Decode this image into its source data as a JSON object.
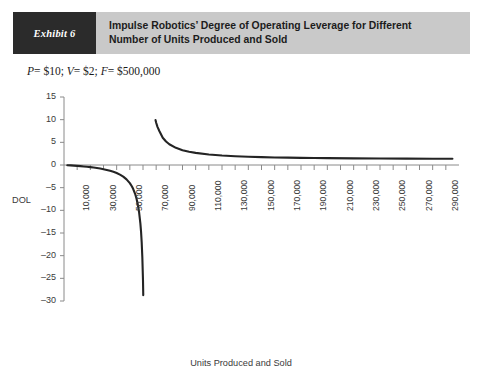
{
  "exhibit": {
    "tag": "Exhibit 6",
    "title_line1": "Impulse Robotics’ Degree of Operating Leverage for Different",
    "title_line2": "Number of Units Produced and Sold",
    "tag_bg": "#2b2b2b",
    "title_bg": "#c9c9c9"
  },
  "parameters": {
    "full": "P = $10; V = $2; F = $500,000",
    "price_symbol": "P",
    "price_value": "= $10;",
    "variable_symbol": "V",
    "variable_value": "= $2;",
    "fixed_symbol": "F",
    "fixed_value": "= $500,000"
  },
  "chart_data": {
    "type": "line",
    "title": "Impulse Robotics’ Degree of Operating Leverage for Different Number of Units Produced and Sold",
    "subtitle": "P = $10; V = $2; F = $500,000",
    "xlabel": "Units Produced and Sold",
    "ylabel": "DOL",
    "xlim": [
      0,
      300000
    ],
    "ylim": [
      -30,
      15
    ],
    "ytick_values": [
      15,
      10,
      5,
      0,
      -5,
      -10,
      -15,
      -20,
      -25,
      -30
    ],
    "ytick_labels": [
      "15",
      "10",
      "5",
      "0",
      "–5",
      "–10",
      "–15",
      "–20",
      "–25",
      "–30"
    ],
    "xtick_values": [
      10000,
      30000,
      50000,
      70000,
      90000,
      110000,
      130000,
      150000,
      170000,
      190000,
      210000,
      230000,
      250000,
      270000,
      290000
    ],
    "xtick_labels": [
      "10,000",
      "30,000",
      "50,000",
      "70,000",
      "90,000",
      "110,000",
      "130,000",
      "150,000",
      "170,000",
      "190,000",
      "210,000",
      "230,000",
      "250,000",
      "270,000",
      "290,000"
    ],
    "grid": false,
    "legend": null,
    "line_color": "#242424",
    "axis_color": "#8a8a8a",
    "breakeven_units": 62500,
    "formula": "DOL = Q(P-V) / (Q(P-V) - F)",
    "series": [
      {
        "name": "DOL below breakeven",
        "x": [
          2500,
          5000,
          7500,
          10000,
          12500,
          15000,
          17500,
          20000,
          22500,
          25000,
          27500,
          30000,
          32500,
          35000,
          37500,
          40000,
          42500,
          45000,
          47500,
          50000,
          51500,
          52500,
          54000,
          55000,
          56000,
          57000,
          58000,
          58500,
          59000,
          59500,
          60000,
          60200
        ],
        "y": [
          -0.042,
          -0.087,
          -0.136,
          -0.19,
          -0.25,
          -0.316,
          -0.389,
          -0.471,
          -0.562,
          -0.667,
          -0.786,
          -0.923,
          -1.083,
          -1.273,
          -1.5,
          -1.778,
          -2.125,
          -2.571,
          -3.167,
          -4.0,
          -4.682,
          -5.25,
          -6.353,
          -7.333,
          -8.615,
          -10.364,
          -12.889,
          -14.625,
          -17.0,
          -20.4,
          -25.5,
          -28.7
        ]
      },
      {
        "name": "DOL above breakeven",
        "x": [
          69500,
          70000,
          71000,
          72500,
          75000,
          77500,
          80000,
          85000,
          90000,
          95000,
          100000,
          110000,
          120000,
          130000,
          140000,
          150000,
          160000,
          170000,
          180000,
          190000,
          200000,
          220000,
          240000,
          260000,
          280000,
          295000
        ],
        "y": [
          9.93,
          9.33,
          8.41,
          7.45,
          6.0,
          5.17,
          4.57,
          3.78,
          3.27,
          2.92,
          2.67,
          2.32,
          2.09,
          1.94,
          1.82,
          1.74,
          1.67,
          1.62,
          1.57,
          1.54,
          1.51,
          1.47,
          1.44,
          1.41,
          1.39,
          1.38
        ]
      }
    ]
  },
  "axis_title": {
    "x": "Units Produced and Sold",
    "y": "DOL"
  }
}
